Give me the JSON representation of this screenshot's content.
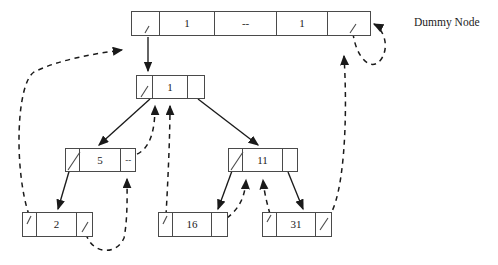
{
  "diagram": {
    "label_dummy": "Dummy Node",
    "dash_mark": "--",
    "colors": {
      "stroke": "#4a4a4a",
      "arrow_solid": "#1a1a1a",
      "arrow_dashed": "#1a1a1a",
      "background": "#ffffff"
    },
    "nodes": [
      {
        "id": "dummy",
        "name": "dummy-node",
        "x": 131,
        "y": 11,
        "w": 240,
        "h": 25,
        "cells": [
          {
            "kind": "pointer",
            "text": ""
          },
          {
            "kind": "value",
            "text": "1"
          },
          {
            "kind": "value",
            "text": "--"
          },
          {
            "kind": "value",
            "text": "1"
          },
          {
            "kind": "pointer",
            "text": ""
          }
        ],
        "widths": [
          28,
          56,
          62,
          52,
          42
        ]
      },
      {
        "id": "root",
        "name": "node-root-1",
        "x": 136,
        "y": 75,
        "w": 69,
        "h": 24,
        "cells": [
          {
            "kind": "pointer",
            "text": ""
          },
          {
            "kind": "value",
            "text": "1"
          },
          {
            "kind": "pointer",
            "text": ""
          }
        ],
        "widths": [
          16,
          37,
          16
        ]
      },
      {
        "id": "n5",
        "name": "node-5",
        "x": 65,
        "y": 148,
        "w": 71,
        "h": 24,
        "cells": [
          {
            "kind": "pointer",
            "text": ""
          },
          {
            "kind": "value",
            "text": "5"
          },
          {
            "kind": "value",
            "text": "--"
          }
        ],
        "widths": [
          14,
          43,
          14
        ]
      },
      {
        "id": "n11",
        "name": "node-11",
        "x": 228,
        "y": 148,
        "w": 70,
        "h": 24,
        "cells": [
          {
            "kind": "pointer",
            "text": ""
          },
          {
            "kind": "value",
            "text": "11"
          },
          {
            "kind": "pointer",
            "text": ""
          }
        ],
        "widths": [
          14,
          42,
          14
        ]
      },
      {
        "id": "n2",
        "name": "leaf-2",
        "x": 22,
        "y": 212,
        "w": 71,
        "h": 25,
        "cells": [
          {
            "kind": "pointer",
            "text": ""
          },
          {
            "kind": "value",
            "text": "2"
          },
          {
            "kind": "pointer",
            "text": ""
          }
        ],
        "widths": [
          14,
          42,
          15
        ]
      },
      {
        "id": "n16",
        "name": "leaf-16",
        "x": 158,
        "y": 212,
        "w": 70,
        "h": 25,
        "cells": [
          {
            "kind": "pointer",
            "text": ""
          },
          {
            "kind": "value",
            "text": "16"
          },
          {
            "kind": "pointer",
            "text": ""
          }
        ],
        "widths": [
          14,
          41,
          15
        ]
      },
      {
        "id": "n31",
        "name": "leaf-31",
        "x": 262,
        "y": 212,
        "w": 70,
        "h": 25,
        "cells": [
          {
            "kind": "pointer",
            "text": ""
          },
          {
            "kind": "value",
            "text": "31"
          },
          {
            "kind": "pointer",
            "text": ""
          }
        ],
        "widths": [
          14,
          41,
          15
        ]
      }
    ],
    "edges_solid": [
      {
        "name": "edge-dummy-to-root",
        "from": "dummy.cell0",
        "to": "root.top"
      },
      {
        "name": "edge-root-to-5",
        "from": "root.cell0",
        "to": "node-5"
      },
      {
        "name": "edge-root-to-11",
        "from": "root.cell2",
        "to": "node-11"
      },
      {
        "name": "edge-5-to-2",
        "from": "node-5.cell0",
        "to": "leaf-2"
      },
      {
        "name": "edge-11-to-16",
        "from": "node-11.cell0",
        "to": "leaf-16"
      },
      {
        "name": "edge-11-to-31",
        "from": "node-11.cell2",
        "to": "leaf-31"
      }
    ],
    "edges_dashed": [
      {
        "name": "backedge-2-to-dummy",
        "from": "leaf-2.cell0",
        "to": "dummy.cell0"
      },
      {
        "name": "backedge-5-to-root",
        "from": "node-5.cell2",
        "to": "root.cell0"
      },
      {
        "name": "backedge-16-to-root",
        "from": "leaf-16.cell0",
        "to": "root.cell1"
      },
      {
        "name": "backedge-2-to-5",
        "from": "leaf-2.cell2",
        "to": "node-5.cell2"
      },
      {
        "name": "backedge-16-to-11",
        "from": "leaf-16.cell2",
        "to": "node-11.cell1"
      },
      {
        "name": "backedge-31-to-11",
        "from": "leaf-31.cell0",
        "to": "node-11.cell2"
      },
      {
        "name": "backedge-31-to-dummy",
        "from": "leaf-31.cell2",
        "to": "dummy.cell3"
      },
      {
        "name": "backedge-dummy-loop",
        "from": "dummy.cell4",
        "to": "dummy.right"
      }
    ]
  }
}
